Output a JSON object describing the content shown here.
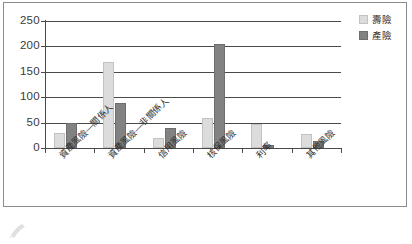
{
  "chart_data": {
    "type": "bar",
    "title": "",
    "xlabel": "",
    "ylabel": "",
    "ylim": [
      0,
      250
    ],
    "yticks": [
      0,
      50,
      100,
      150,
      200,
      250
    ],
    "grid": true,
    "legend_position": "right",
    "categories": [
      "資產風險—關係人",
      "資產風險—非關係人",
      "信用風險",
      "核保風險",
      "利率",
      "其他風險"
    ],
    "series": [
      {
        "name": "壽險",
        "color": "#dcdcdc",
        "values": [
          30,
          170,
          20,
          60,
          47,
          28
        ]
      },
      {
        "name": "產險",
        "color": "#828282",
        "values": [
          50,
          89,
          39,
          205,
          5,
          14
        ]
      }
    ]
  },
  "axis": {
    "y_tick_labels": [
      "250",
      "200",
      "150",
      "100",
      "50",
      "0"
    ]
  },
  "legend": {
    "items": [
      {
        "label": "壽險"
      },
      {
        "label": "產險"
      }
    ]
  }
}
